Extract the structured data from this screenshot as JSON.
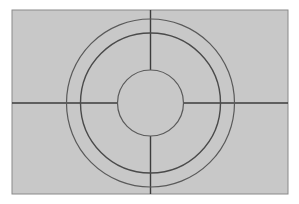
{
  "diagram": {
    "background": "#ffffff",
    "panel": {
      "x": 12,
      "y": 10,
      "width": 276,
      "height": 184,
      "fill": "#c8c8c8",
      "stroke": "#8a8a8a"
    },
    "center": {
      "x": 150.5,
      "y": 103
    },
    "circles": [
      {
        "name": "outer-ring",
        "r": 84,
        "stroke": "#5a5a5a",
        "width": 1.2
      },
      {
        "name": "middle-ring",
        "r": 70,
        "stroke": "#4a4a4a",
        "width": 1.4
      },
      {
        "name": "inner-circle",
        "r": 33,
        "stroke": "#5a5a5a",
        "width": 1.2
      }
    ],
    "crosshair": {
      "stroke": "#3c3c3c",
      "width": 1.4
    }
  }
}
